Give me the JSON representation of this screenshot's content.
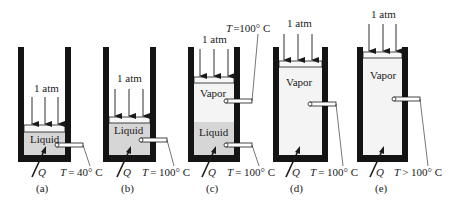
{
  "figure": {
    "colors": {
      "wall": "#141414",
      "liquid": "#d6d6d6",
      "vapor": "#f4f4f4",
      "piston": "#f8f8f8",
      "line": "#1a1a1a",
      "background": "#ffffff"
    },
    "panels": [
      {
        "id": "a",
        "caption": "(a)",
        "pressure_label": "1 atm",
        "phases": [
          "Liquid"
        ],
        "heat_label": "Q",
        "temp_labels": [
          {
            "var": "T",
            "text": "= 40° C",
            "position": "bottom"
          }
        ]
      },
      {
        "id": "b",
        "caption": "(b)",
        "pressure_label": "1 atm",
        "phases": [
          "Liquid"
        ],
        "heat_label": "Q",
        "temp_labels": [
          {
            "var": "T",
            "text": "= 100° C",
            "position": "bottom"
          }
        ]
      },
      {
        "id": "c",
        "caption": "(c)",
        "pressure_label": "1 atm",
        "phases": [
          "Vapor",
          "Liquid"
        ],
        "heat_label": "Q",
        "temp_labels": [
          {
            "var": "T",
            "text": "=100° C",
            "position": "top"
          },
          {
            "var": "T",
            "text": "= 100° C",
            "position": "bottom"
          }
        ]
      },
      {
        "id": "d",
        "caption": "(d)",
        "pressure_label": "1 atm",
        "phases": [
          "Vapor"
        ],
        "heat_label": "Q",
        "temp_labels": [
          {
            "var": "T",
            "text": "= 100° C",
            "position": "bottom"
          }
        ]
      },
      {
        "id": "e",
        "caption": "(e)",
        "pressure_label": "1 atm",
        "phases": [
          "Vapor"
        ],
        "heat_label": "Q",
        "temp_labels": [
          {
            "var": "T",
            "text": "> 100° C",
            "position": "bottom"
          }
        ]
      }
    ]
  }
}
